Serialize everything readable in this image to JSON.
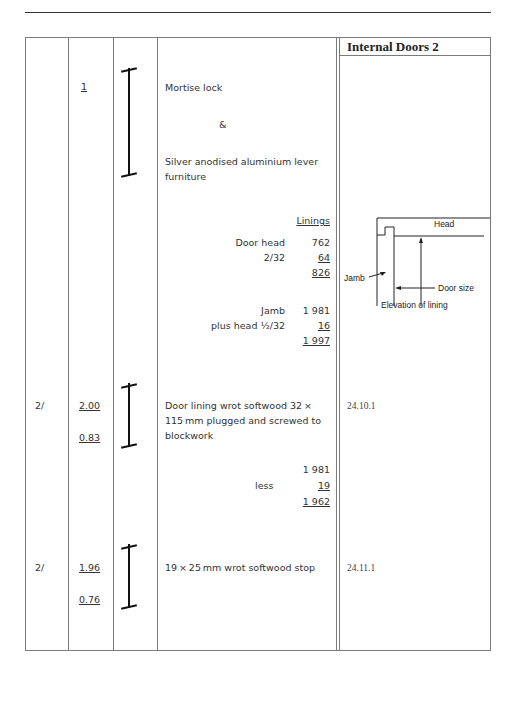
{
  "page": {
    "section_title": "Internal Doors 2"
  },
  "items": [
    {
      "timesing": "",
      "dimensions": [
        "1"
      ],
      "description_lines": [
        "Mortise lock",
        "&",
        "Silver anodised aluminium lever",
        "furniture"
      ],
      "reference": ""
    },
    {
      "waste": {
        "heading": "Linings",
        "lines": [
          {
            "label": "Door head",
            "value": "762"
          },
          {
            "label": "2/32",
            "value": "64"
          },
          {
            "label": "",
            "value": "826"
          },
          {
            "label": "Jamb",
            "value": "1 981"
          },
          {
            "label": "plus head ½/32",
            "value": "16"
          },
          {
            "label": "",
            "value": "1 997"
          }
        ]
      }
    },
    {
      "timesing": "2/",
      "dimensions": [
        "2.00",
        "0.83"
      ],
      "description_lines": [
        "Door lining wrot softwood 32 ×",
        "115 mm plugged and screwed to",
        "blockwork"
      ],
      "reference": "24.10.1",
      "waste": {
        "lines": [
          {
            "label": "",
            "value": "1 981"
          },
          {
            "label": "less",
            "value": "19"
          },
          {
            "label": "",
            "value": "1 962"
          }
        ]
      }
    },
    {
      "timesing": "2/",
      "dimensions": [
        "1.96",
        "0.76"
      ],
      "description_lines": [
        "19 × 25 mm wrot softwood stop"
      ],
      "reference": "24.11.1"
    }
  ],
  "diagram": {
    "labels": {
      "head": "Head",
      "jamb": "Jamb",
      "door_size": "Door size",
      "caption": "Elevation of lining"
    }
  }
}
